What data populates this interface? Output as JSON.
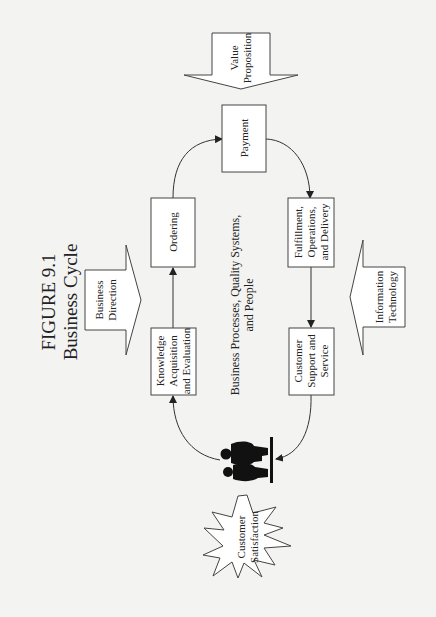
{
  "figure": {
    "number": "FIGURE 9.1",
    "title": "Business Cycle"
  },
  "drivers": {
    "business_direction": [
      "Business",
      "Direction"
    ],
    "value_proposition": [
      "Value",
      "Proposition"
    ],
    "information_technology": [
      "Information",
      "Technology"
    ]
  },
  "process_steps": {
    "payment": [
      "Payment"
    ],
    "ordering": [
      "Ordering"
    ],
    "fulfillment": [
      "Fulfillment,",
      "Operations,",
      "and Delivery"
    ],
    "knowledge": [
      "Knowledge",
      "Acquisition",
      "and Evaluation"
    ],
    "customer_support": [
      "Customer",
      "Support and",
      "Service"
    ]
  },
  "center_label": [
    "Business Processes, Quality Systems,",
    "and People"
  ],
  "outcome": [
    "Customer",
    "Satisfaction"
  ],
  "people_icon": "people-at-counter-icon",
  "colors": {
    "background": "#f3f3f1",
    "stroke": "#444444",
    "silhouette": "#111111",
    "text": "#222222"
  }
}
